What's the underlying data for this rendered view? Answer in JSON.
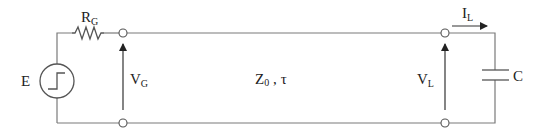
{
  "diagram": {
    "source": {
      "label": "E",
      "type": "step-voltage-source"
    },
    "resistor": {
      "label_main": "R",
      "label_sub": "G"
    },
    "input_voltage": {
      "label_main": "V",
      "label_sub": "G"
    },
    "line": {
      "impedance_main": "Z",
      "impedance_sub": "0",
      "separator": " ,",
      "delay": "τ"
    },
    "load_voltage": {
      "label_main": "V",
      "label_sub": "L"
    },
    "load_current": {
      "label_main": "I",
      "label_sub": "L"
    },
    "load": {
      "label": "C",
      "type": "capacitor"
    },
    "colors": {
      "wire": "#7a7a7a",
      "component": "#555555",
      "text": "#222222",
      "background": "#ffffff"
    }
  }
}
